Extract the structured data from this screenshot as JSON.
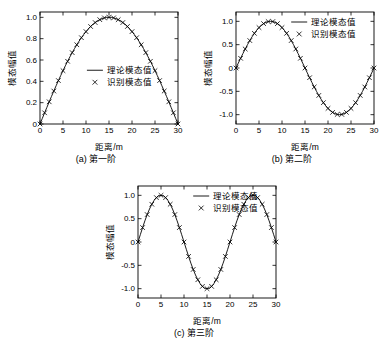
{
  "figure": {
    "panels": [
      {
        "id": "panel-a",
        "caption": "(a) 第一阶",
        "chart_index": 0
      },
      {
        "id": "panel-b",
        "caption": "(b) 第二阶",
        "chart_index": 1
      },
      {
        "id": "panel-c",
        "caption": "(c) 第三阶",
        "chart_index": 2
      }
    ]
  },
  "chart_data": [
    {
      "type": "line",
      "title": "",
      "xlabel": "距离/m",
      "ylabel": "模态幅值",
      "xlim": [
        0,
        30
      ],
      "ylim": [
        0,
        1.05
      ],
      "xticks": [
        0,
        5,
        10,
        15,
        20,
        25,
        30
      ],
      "yticks": [
        0,
        0.2,
        0.4,
        0.6,
        0.8,
        1.0
      ],
      "ytick_labels": [
        "0",
        "0.2",
        "0.4",
        "0.6",
        "0.8",
        "1.0"
      ],
      "grid": false,
      "legend_position": "center",
      "legend": [
        "理论模态值",
        "识别模态值"
      ],
      "series": [
        {
          "name": "理论模态值",
          "marker": "line",
          "x": [
            0,
            0.5,
            1,
            1.5,
            2,
            2.5,
            3,
            3.5,
            4,
            4.5,
            5,
            5.5,
            6,
            6.5,
            7,
            7.5,
            8,
            8.5,
            9,
            9.5,
            10,
            10.5,
            11,
            11.5,
            12,
            12.5,
            13,
            13.5,
            14,
            14.5,
            15,
            15.5,
            16,
            16.5,
            17,
            17.5,
            18,
            18.5,
            19,
            19.5,
            20,
            20.5,
            21,
            21.5,
            22,
            22.5,
            23,
            23.5,
            24,
            24.5,
            25,
            25.5,
            26,
            26.5,
            27,
            27.5,
            28,
            28.5,
            29,
            29.5,
            30
          ],
          "y": [
            0.0,
            0.052,
            0.105,
            0.156,
            0.208,
            0.259,
            0.309,
            0.358,
            0.407,
            0.454,
            0.5,
            0.545,
            0.588,
            0.629,
            0.669,
            0.707,
            0.743,
            0.777,
            0.809,
            0.839,
            0.866,
            0.891,
            0.914,
            0.934,
            0.951,
            0.966,
            0.978,
            0.988,
            0.995,
            0.999,
            1.0,
            0.999,
            0.995,
            0.988,
            0.978,
            0.966,
            0.951,
            0.934,
            0.914,
            0.891,
            0.866,
            0.839,
            0.809,
            0.777,
            0.743,
            0.707,
            0.669,
            0.629,
            0.588,
            0.545,
            0.5,
            0.454,
            0.407,
            0.358,
            0.309,
            0.259,
            0.208,
            0.156,
            0.105,
            0.052,
            0.0
          ]
        },
        {
          "name": "识别模态值",
          "marker": "x",
          "x": [
            0,
            1,
            2,
            3,
            4,
            5,
            6,
            7,
            8,
            9,
            10,
            11,
            12,
            13,
            14,
            15,
            16,
            17,
            18,
            19,
            20,
            21,
            22,
            23,
            24,
            25,
            26,
            27,
            28,
            29,
            30
          ],
          "y": [
            0.0,
            0.105,
            0.208,
            0.309,
            0.407,
            0.5,
            0.588,
            0.669,
            0.743,
            0.809,
            0.866,
            0.914,
            0.951,
            0.978,
            0.995,
            1.0,
            0.995,
            0.978,
            0.951,
            0.914,
            0.866,
            0.809,
            0.743,
            0.669,
            0.588,
            0.5,
            0.407,
            0.309,
            0.208,
            0.105,
            0.0
          ]
        }
      ]
    },
    {
      "type": "line",
      "title": "",
      "xlabel": "距离/m",
      "ylabel": "模态幅值",
      "xlim": [
        0,
        30
      ],
      "ylim": [
        -1.2,
        1.2
      ],
      "xticks": [
        0,
        5,
        10,
        15,
        20,
        25,
        30
      ],
      "yticks": [
        -1.0,
        -0.5,
        0,
        0.5,
        1.0
      ],
      "ytick_labels": [
        "-1.0",
        "-0.5",
        "0",
        "0.5",
        "1.0"
      ],
      "grid": false,
      "legend_position": "top-right",
      "legend": [
        "理论模态值",
        "识别模态值"
      ],
      "series": [
        {
          "name": "理论模态值",
          "marker": "line",
          "x": [
            0,
            0.5,
            1,
            1.5,
            2,
            2.5,
            3,
            3.5,
            4,
            4.5,
            5,
            5.5,
            6,
            6.5,
            7,
            7.5,
            8,
            8.5,
            9,
            9.5,
            10,
            10.5,
            11,
            11.5,
            12,
            12.5,
            13,
            13.5,
            14,
            14.5,
            15,
            15.5,
            16,
            16.5,
            17,
            17.5,
            18,
            18.5,
            19,
            19.5,
            20,
            20.5,
            21,
            21.5,
            22,
            22.5,
            23,
            23.5,
            24,
            24.5,
            25,
            25.5,
            26,
            26.5,
            27,
            27.5,
            28,
            28.5,
            29,
            29.5,
            30
          ],
          "y": [
            0.0,
            0.105,
            0.208,
            0.309,
            0.407,
            0.5,
            0.588,
            0.669,
            0.743,
            0.809,
            0.866,
            0.914,
            0.951,
            0.978,
            0.995,
            1.0,
            0.995,
            0.978,
            0.951,
            0.914,
            0.866,
            0.809,
            0.743,
            0.669,
            0.588,
            0.5,
            0.407,
            0.309,
            0.208,
            0.105,
            0.0,
            -0.105,
            -0.208,
            -0.309,
            -0.407,
            -0.5,
            -0.588,
            -0.669,
            -0.743,
            -0.809,
            -0.866,
            -0.914,
            -0.951,
            -0.978,
            -0.995,
            -1.0,
            -0.995,
            -0.978,
            -0.951,
            -0.914,
            -0.866,
            -0.809,
            -0.743,
            -0.669,
            -0.588,
            -0.5,
            -0.407,
            -0.309,
            -0.208,
            -0.105,
            0.0
          ]
        },
        {
          "name": "识别模态值",
          "marker": "x",
          "x": [
            0,
            1,
            2,
            3,
            4,
            5,
            6,
            7,
            8,
            9,
            10,
            11,
            12,
            13,
            14,
            15,
            16,
            17,
            18,
            19,
            20,
            21,
            22,
            23,
            24,
            25,
            26,
            27,
            28,
            29,
            30
          ],
          "y": [
            0.0,
            0.208,
            0.407,
            0.588,
            0.743,
            0.866,
            0.951,
            0.995,
            0.995,
            0.951,
            0.866,
            0.743,
            0.588,
            0.407,
            0.208,
            0.0,
            -0.208,
            -0.407,
            -0.588,
            -0.743,
            -0.866,
            -0.951,
            -0.995,
            -0.995,
            -0.951,
            -0.866,
            -0.743,
            -0.588,
            -0.407,
            -0.208,
            0.0
          ]
        }
      ]
    },
    {
      "type": "line",
      "title": "",
      "xlabel": "距离/m",
      "ylabel": "模态幅值",
      "xlim": [
        0,
        30
      ],
      "ylim": [
        -1.2,
        1.2
      ],
      "xticks": [
        0,
        5,
        10,
        15,
        20,
        25,
        30
      ],
      "yticks": [
        -1.0,
        -0.5,
        0,
        0.5,
        1.0
      ],
      "ytick_labels": [
        "-1.0",
        "-0.5",
        "0",
        "0.5",
        "1.0"
      ],
      "grid": false,
      "legend_position": "top-right",
      "legend": [
        "理论模态值",
        "识别模态值"
      ],
      "series": [
        {
          "name": "理论模态值",
          "marker": "line",
          "x": [
            0,
            0.5,
            1,
            1.5,
            2,
            2.5,
            3,
            3.5,
            4,
            4.5,
            5,
            5.5,
            6,
            6.5,
            7,
            7.5,
            8,
            8.5,
            9,
            9.5,
            10,
            10.5,
            11,
            11.5,
            12,
            12.5,
            13,
            13.5,
            14,
            14.5,
            15,
            15.5,
            16,
            16.5,
            17,
            17.5,
            18,
            18.5,
            19,
            19.5,
            20,
            20.5,
            21,
            21.5,
            22,
            22.5,
            23,
            23.5,
            24,
            24.5,
            25,
            25.5,
            26,
            26.5,
            27,
            27.5,
            28,
            28.5,
            29,
            29.5,
            30
          ],
          "y": [
            0.0,
            0.156,
            0.309,
            0.454,
            0.588,
            0.707,
            0.809,
            0.891,
            0.951,
            0.988,
            1.0,
            0.988,
            0.951,
            0.891,
            0.809,
            0.707,
            0.588,
            0.454,
            0.309,
            0.156,
            0.0,
            -0.156,
            -0.309,
            -0.454,
            -0.588,
            -0.707,
            -0.809,
            -0.891,
            -0.951,
            -0.988,
            -1.0,
            -0.988,
            -0.951,
            -0.891,
            -0.809,
            -0.707,
            -0.588,
            -0.454,
            -0.309,
            -0.156,
            0.0,
            0.156,
            0.309,
            0.454,
            0.588,
            0.707,
            0.809,
            0.891,
            0.951,
            0.988,
            1.0,
            0.988,
            0.951,
            0.891,
            0.809,
            0.707,
            0.588,
            0.454,
            0.309,
            0.156,
            0.0
          ]
        },
        {
          "name": "识别模态值",
          "marker": "x",
          "x": [
            0,
            1,
            2,
            3,
            4,
            5,
            6,
            7,
            8,
            9,
            10,
            11,
            12,
            13,
            14,
            15,
            16,
            17,
            18,
            19,
            20,
            21,
            22,
            23,
            24,
            25,
            26,
            27,
            28,
            29,
            30
          ],
          "y": [
            0.0,
            0.309,
            0.588,
            0.809,
            0.951,
            1.0,
            0.951,
            0.809,
            0.588,
            0.309,
            0.0,
            -0.309,
            -0.588,
            -0.809,
            -0.951,
            -1.0,
            -0.951,
            -0.809,
            -0.588,
            -0.309,
            0.0,
            0.309,
            0.588,
            0.809,
            0.951,
            1.0,
            0.951,
            0.809,
            0.588,
            0.309,
            0.0
          ]
        }
      ]
    }
  ]
}
